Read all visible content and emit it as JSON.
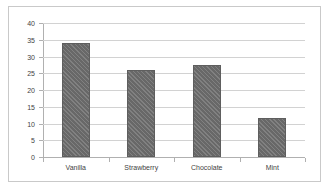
{
  "chart_data": {
    "type": "bar",
    "title": "",
    "subtitle": "",
    "xlabel": "",
    "ylabel": "",
    "categories": [
      "Vanilla",
      "Strawberry",
      "Chocolate",
      "Mint"
    ],
    "values": [
      34,
      26,
      27.5,
      11.5
    ],
    "ylim": [
      0,
      40
    ],
    "ytick_labels": [
      "40",
      "35",
      "30",
      "25",
      "20",
      "15",
      "10",
      "5",
      "0"
    ],
    "ytick_values": [
      40,
      35,
      30,
      25,
      20,
      15,
      10,
      5,
      0
    ],
    "grid": true,
    "legend": false,
    "legend_position": "none",
    "bar_color": "#6e6e6e",
    "gridline_color": "#d2d2d2",
    "axis_color": "#b0b0b0",
    "text_color": "#3f3f3f",
    "background_color": "#ffffff",
    "border_color": "#c9c9c9"
  }
}
